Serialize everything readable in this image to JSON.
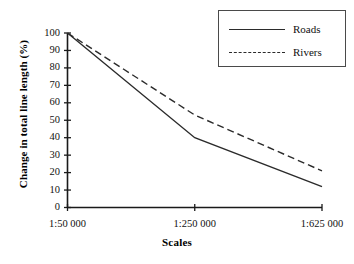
{
  "chart_data": {
    "type": "line",
    "title": "",
    "xlabel": "Scales",
    "ylabel": "Change in total line length (%)",
    "categories": [
      "1:50 000",
      "1:250 000",
      "1:625 000"
    ],
    "series": [
      {
        "name": "Roads",
        "values": [
          100,
          40,
          12
        ],
        "style": "solid"
      },
      {
        "name": "Rivers",
        "values": [
          100,
          53,
          21
        ],
        "style": "dashed"
      }
    ],
    "ylim": [
      0,
      100
    ],
    "yticks": [
      0,
      10,
      20,
      30,
      40,
      50,
      60,
      70,
      80,
      90,
      100
    ],
    "ytick_labels": [
      "0",
      "10",
      "20",
      "30",
      "40",
      "50",
      "60",
      "70",
      "80",
      "90",
      "100"
    ],
    "grid": false,
    "legend_position": "top-right",
    "line_color": "#2b2b2b",
    "axis_color": "#1a1a1a"
  },
  "axes": {
    "x_title": "Scales",
    "y_title": "Change in total line length (%)",
    "x_labels": [
      "1:50 000",
      "1:250 000",
      "1:625 000"
    ],
    "y_labels": [
      "100",
      "90",
      "80",
      "70",
      "60",
      "50",
      "40",
      "30",
      "20",
      "10",
      "0"
    ]
  },
  "legend": {
    "entries": [
      {
        "label": "Roads",
        "style": "solid"
      },
      {
        "label": "Rivers",
        "style": "dashed"
      }
    ]
  }
}
